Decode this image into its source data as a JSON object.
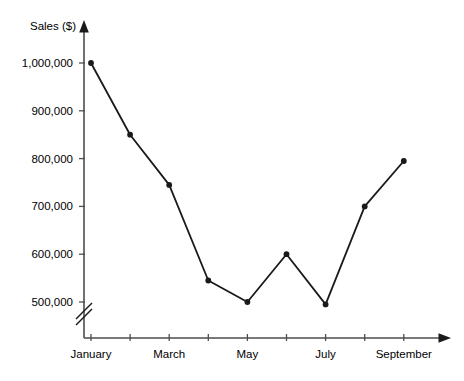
{
  "chart_data": {
    "type": "line",
    "title": "",
    "xlabel": "",
    "ylabel": "Sales ($)",
    "categories": [
      "January",
      "February",
      "March",
      "April",
      "May",
      "June",
      "July",
      "August",
      "September"
    ],
    "x_tick_labels": [
      "January",
      "",
      "March",
      "",
      "May",
      "",
      "July",
      "",
      "September"
    ],
    "values": [
      1000000,
      850000,
      745000,
      545000,
      500000,
      600000,
      495000,
      700000,
      795000
    ],
    "y_tick_labels": [
      "500,000",
      "600,000",
      "700,000",
      "800,000",
      "900,000",
      "1,000,000"
    ],
    "y_tick_values": [
      500000,
      600000,
      700000,
      800000,
      900000,
      1000000
    ],
    "ylim": [
      500000,
      1000000
    ],
    "grid": false,
    "legend": null,
    "axis_break": true,
    "marker": "filled-circle",
    "line_color": "#1a1a1a",
    "axis_color": "#4d4d4d",
    "text_color": "#000000"
  },
  "axes": {
    "y_axis_name": "y-axis",
    "x_axis_name": "x-axis",
    "y_arrow_name": "y-axis-arrowhead",
    "x_arrow_name": "x-axis-arrowhead",
    "break_name": "y-axis-break-symbol"
  }
}
